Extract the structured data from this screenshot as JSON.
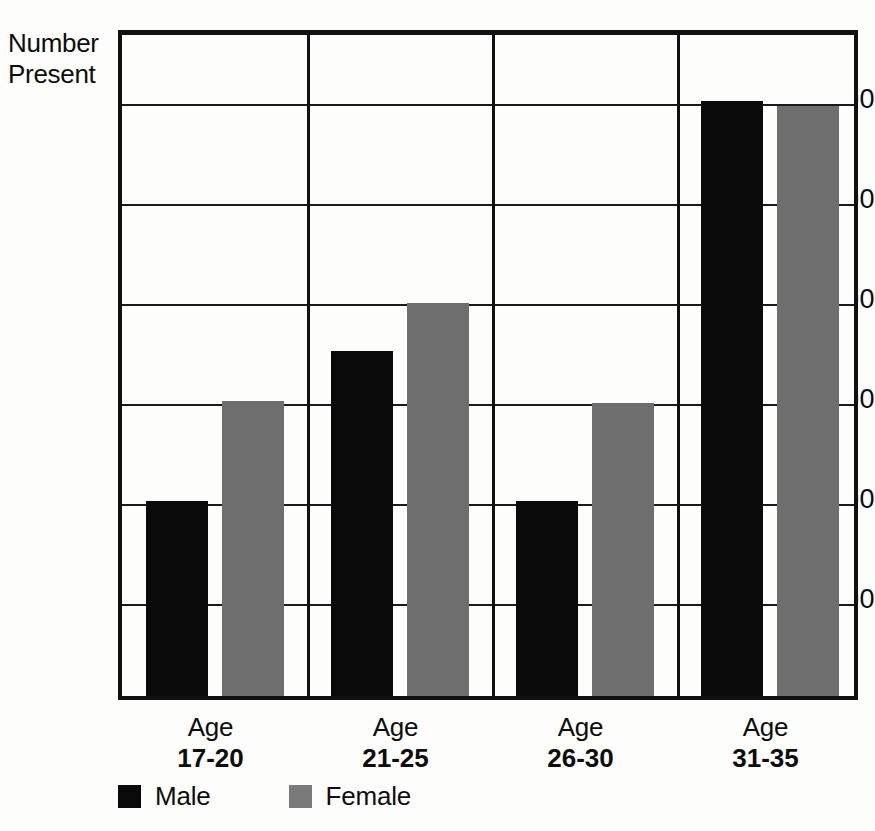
{
  "chart_data": {
    "type": "bar",
    "title": "",
    "subtitle": "",
    "xlabel": "",
    "ylabel": "Number Present",
    "ylabel_line1": "Number",
    "ylabel_line2": "Present",
    "categories": [
      "Age 17-20",
      "Age 21-25",
      "Age 26-30",
      "Age 31-35"
    ],
    "category_lines": [
      {
        "line1": "Age",
        "line2": "17-20"
      },
      {
        "line1": "Age",
        "line2": "21-25"
      },
      {
        "line1": "Age",
        "line2": "26-30"
      },
      {
        "line1": "Age",
        "line2": "31-35"
      }
    ],
    "series": [
      {
        "name": "Male",
        "color": "#0a0a0a",
        "values": [
          195,
          345,
          195,
          595
        ]
      },
      {
        "name": "Female",
        "color": "#6e6e6e",
        "values": [
          295,
          393,
          293,
          590
        ]
      }
    ],
    "ylim": [
      0,
      670
    ],
    "yticks": [
      100,
      200,
      300,
      400,
      500,
      600
    ],
    "ytick_labels": [
      "100",
      "200",
      "300",
      "400",
      "500",
      "600"
    ],
    "grid": true,
    "grid_axis": "y",
    "legend_position": "bottom-left"
  },
  "legend": {
    "items": [
      {
        "label": "Male",
        "swatch": "male-swatch"
      },
      {
        "label": "Female",
        "swatch": "female-swatch"
      }
    ]
  },
  "colors": {
    "male": "#0a0a0a",
    "female": "#6e6e6e",
    "axis": "#111111",
    "background": "#fdfdfc"
  }
}
